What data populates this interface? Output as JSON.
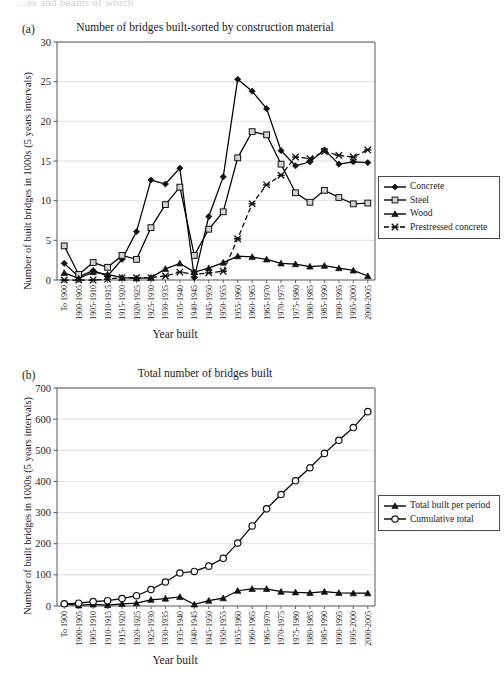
{
  "page": {
    "cut_off_header": "...es and beams of which"
  },
  "panels": [
    {
      "letter": "(a)",
      "title": "Number of bridges built-sorted by construction material",
      "ylabel": "Number of built bridges in 1000s (5 years intervals)",
      "xlabel": "Year built",
      "legend": [
        {
          "label": "Concrete",
          "marker": "diamond",
          "dash": false
        },
        {
          "label": "Steel",
          "marker": "square",
          "dash": false
        },
        {
          "label": "Wood",
          "marker": "triangle",
          "dash": false
        },
        {
          "label": "Prestressed concrete",
          "marker": "cross",
          "dash": true
        }
      ]
    },
    {
      "letter": "(b)",
      "title": "Total number of bridges built",
      "ylabel": "Number of built bridges in 1000s (5 years intervals)",
      "xlabel": "Year built",
      "legend": [
        {
          "label": "Total built per period",
          "marker": "triangle",
          "dash": false
        },
        {
          "label": "Cumulative total",
          "marker": "circle",
          "dash": false
        }
      ]
    }
  ],
  "chart_data": [
    {
      "type": "line",
      "title": "Number of bridges built-sorted by construction material",
      "xlabel": "Year built",
      "ylabel": "Number of built bridges in 1000s (5 years intervals)",
      "ylim": [
        0,
        30
      ],
      "yticks": [
        0,
        5,
        10,
        15,
        20,
        25,
        30
      ],
      "grid": true,
      "legend_position": "right",
      "categories": [
        "To 1900",
        "1900-1905",
        "1905-1910",
        "1910-1915",
        "1915-1920",
        "1920-1925",
        "1925-1930",
        "1930-1935",
        "1935-1940",
        "1940-1945",
        "1945-1950",
        "1950-1955",
        "1955-1960",
        "1960-1965",
        "1965-1970",
        "1970-1975",
        "1975-1980",
        "1980-1985",
        "1985-1990",
        "1990-1995",
        "1995-2000",
        "2000-2005"
      ],
      "series": [
        {
          "name": "Concrete",
          "marker": "diamond",
          "values": [
            2.1,
            0.4,
            1.2,
            0.5,
            2.6,
            6.1,
            12.6,
            12.1,
            14.1,
            0.3,
            8.0,
            13.0,
            25.3,
            23.8,
            21.6,
            16.3,
            14.4,
            14.9,
            16.4,
            14.6,
            14.9,
            14.8
          ]
        },
        {
          "name": "Steel",
          "marker": "square",
          "values": [
            4.3,
            0.7,
            2.2,
            1.6,
            3.1,
            2.6,
            6.6,
            9.5,
            11.7,
            3.1,
            6.4,
            8.6,
            15.4,
            18.7,
            18.3,
            14.6,
            11.0,
            9.8,
            11.3,
            10.4,
            9.6,
            9.7
          ]
        },
        {
          "name": "Wood",
          "marker": "triangle",
          "values": [
            0.9,
            0.2,
            1.0,
            0.7,
            0.3,
            0.2,
            0.3,
            1.4,
            2.1,
            1.0,
            1.5,
            2.2,
            3.0,
            2.9,
            2.6,
            2.1,
            2.0,
            1.7,
            1.8,
            1.5,
            1.2,
            0.5
          ]
        },
        {
          "name": "Prestressed concrete",
          "marker": "cross",
          "dash": true,
          "values": [
            0,
            0,
            0,
            0.1,
            0.3,
            0.3,
            0.3,
            0.5,
            1.0,
            0.7,
            0.9,
            1.1,
            5.2,
            9.6,
            12.0,
            13.2,
            15.5,
            15.3,
            16.2,
            15.7,
            15.5,
            16.4
          ]
        }
      ]
    },
    {
      "type": "line",
      "title": "Total number of bridges built",
      "xlabel": "Year built",
      "ylabel": "Number of built bridges in 1000s (5 years intervals)",
      "ylim": [
        0,
        700
      ],
      "yticks": [
        0,
        100,
        200,
        300,
        400,
        500,
        600,
        700
      ],
      "grid": true,
      "legend_position": "right",
      "categories": [
        "To 1900",
        "1900-1905",
        "1905-1910",
        "1910-1915",
        "1915-1920",
        "1920-1925",
        "1925-1930",
        "1930-1935",
        "1935-1940",
        "1940-1945",
        "1945-1950",
        "1950-1955",
        "1955-1960",
        "1960-1965",
        "1965-1970",
        "1970-1975",
        "1975-1980",
        "1980-1985",
        "1985-1990",
        "1990-1995",
        "1995-2000",
        "2000-2005"
      ],
      "series": [
        {
          "name": "Total built per period",
          "marker": "triangle",
          "values": [
            7,
            2,
            5,
            3,
            7,
            9,
            20,
            24,
            29,
            5,
            17,
            25,
            49,
            55,
            55,
            46,
            44,
            42,
            46,
            42,
            41,
            41
          ]
        },
        {
          "name": "Cumulative total",
          "marker": "circle",
          "values": [
            7,
            9,
            14,
            17,
            24,
            33,
            53,
            77,
            106,
            111,
            128,
            153,
            202,
            257,
            312,
            358,
            402,
            444,
            490,
            532,
            573,
            624
          ]
        }
      ]
    }
  ]
}
